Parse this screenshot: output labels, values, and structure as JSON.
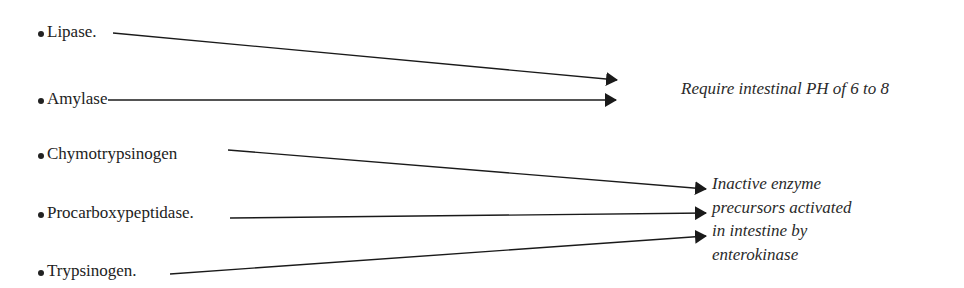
{
  "enzymes": [
    {
      "label": "Lipase.",
      "group": "ph_requirement"
    },
    {
      "label": "Amylase",
      "group": "ph_requirement"
    },
    {
      "label": "Chymotrypsinogen",
      "group": "inactive_precursors"
    },
    {
      "label": "Procarboxypeptidase.",
      "group": "inactive_precursors"
    },
    {
      "label": "Trypsinogen.",
      "group": "inactive_precursors"
    }
  ],
  "targets": {
    "ph_requirement": {
      "text": "Require intestinal PH of 6 to 8"
    },
    "inactive_precursors": {
      "lines": [
        "Inactive enzyme",
        "precursors activated",
        "in intestine by",
        "enterokinase"
      ]
    }
  },
  "colors": {
    "text": "#222222",
    "arrow": "#1a1a1a",
    "background": "#ffffff"
  }
}
